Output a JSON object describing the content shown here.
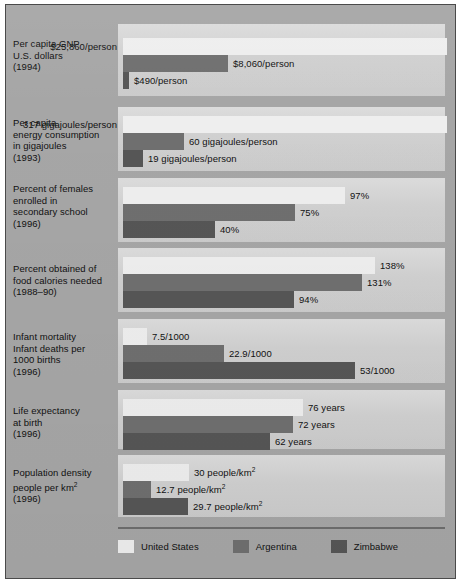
{
  "figure": {
    "width": 461,
    "height": 583,
    "background_color": "#a6a6a6",
    "panel_color": "#d2d2d2",
    "border_color": "#4a4a4a"
  },
  "legend": {
    "position": "bottom-left",
    "items": [
      {
        "label": "United States",
        "color": "#eeeeee",
        "key": "united_states"
      },
      {
        "label": "Argentina",
        "color": "#6f6f6f",
        "key": "argentina"
      },
      {
        "label": "Zimbabwe",
        "color": "#565656",
        "key": "zimbabwe"
      }
    ]
  },
  "chart_data": {
    "type": "bar",
    "orientation": "horizontal",
    "title": "",
    "subtitle": "",
    "xlabel": "",
    "ylabel": "",
    "grid": false,
    "legend_position": "bottom-left",
    "series": [
      {
        "name": "United States",
        "color": "#eeeeee"
      },
      {
        "name": "Argentina",
        "color": "#6f6f6f"
      },
      {
        "name": "Zimbabwe",
        "color": "#565656"
      }
    ],
    "categories": [
      "Per capita GNP U.S. dollars (1994)",
      "Per capita energy consumption in gigajoules (1993)",
      "Percent of females enrolled in secondary school (1996)",
      "Percent obtained of food calories needed (1988–90)",
      "Infant mortality Infant deaths per 1000 births (1996)",
      "Life expectancy at birth (1996)",
      "Population density people per km2 (1996)"
    ],
    "groups": [
      {
        "label_lines": [
          "Per capita GNP",
          "U.S. dollars",
          "(1994)"
        ],
        "unit": "/person",
        "max_value": 25860,
        "bars": [
          {
            "series": "United States",
            "value": 25860,
            "value_label": "$25,860/person",
            "bar_px": 324,
            "label_px": 325,
            "label_align": "right",
            "label_right_px": 6
          },
          {
            "series": "Argentina",
            "value": 8060,
            "value_label": "$8,060/person",
            "bar_px": 105,
            "label_px": 110
          },
          {
            "series": "Zimbabwe",
            "value": 490,
            "value_label": "$490/person",
            "bar_px": 6,
            "label_px": 11
          }
        ]
      },
      {
        "label_lines": [
          "Per capita",
          "energy consumption",
          "in gigajoules",
          "(1993)"
        ],
        "unit": " gigajoules/person",
        "max_value": 317,
        "bars": [
          {
            "series": "United States",
            "value": 317,
            "value_label": "317 gigajoules/person",
            "bar_px": 324,
            "label_px": 325,
            "label_align": "right",
            "label_right_px": 6
          },
          {
            "series": "Argentina",
            "value": 60,
            "value_label": "60 gigajoules/person",
            "bar_px": 61,
            "label_px": 66
          },
          {
            "series": "Zimbabwe",
            "value": 19,
            "value_label": "19 gigajoules/person",
            "bar_px": 20,
            "label_px": 25
          }
        ]
      },
      {
        "label_lines": [
          "Percent of females",
          "enrolled in",
          "secondary school",
          "(1996)"
        ],
        "unit": "%",
        "max_value": 97,
        "bars": [
          {
            "series": "United States",
            "value": 97,
            "value_label": "97%",
            "bar_px": 222,
            "label_px": 227
          },
          {
            "series": "Argentina",
            "value": 75,
            "value_label": "75%",
            "bar_px": 172,
            "label_px": 177
          },
          {
            "series": "Zimbabwe",
            "value": 40,
            "value_label": "40%",
            "bar_px": 92,
            "label_px": 97
          }
        ]
      },
      {
        "label_lines": [
          "Percent obtained of",
          "food calories needed",
          "(1988–90)"
        ],
        "unit": "%",
        "max_value": 138,
        "bars": [
          {
            "series": "United States",
            "value": 138,
            "value_label": "138%",
            "bar_px": 252,
            "label_px": 257
          },
          {
            "series": "Argentina",
            "value": 131,
            "value_label": "131%",
            "bar_px": 239,
            "label_px": 244
          },
          {
            "series": "Zimbabwe",
            "value": 94,
            "value_label": "94%",
            "bar_px": 171,
            "label_px": 176
          }
        ]
      },
      {
        "label_lines": [
          "Infant mortality",
          "Infant deaths per",
          "1000 births",
          "(1996)"
        ],
        "unit": "/1000",
        "max_value": 53,
        "bars": [
          {
            "series": "United States",
            "value": 7.5,
            "value_label": "7.5/1000",
            "bar_px": 24,
            "label_px": 29
          },
          {
            "series": "Argentina",
            "value": 22.9,
            "value_label": "22.9/1000",
            "bar_px": 101,
            "label_px": 106
          },
          {
            "series": "Zimbabwe",
            "value": 53,
            "value_label": "53/1000",
            "bar_px": 232,
            "label_px": 237
          }
        ]
      },
      {
        "label_lines": [
          "Life expectancy",
          "at birth",
          "(1996)"
        ],
        "unit": " years",
        "max_value": 76,
        "bars": [
          {
            "series": "United States",
            "value": 76,
            "value_label": "76 years",
            "bar_px": 180,
            "label_px": 185
          },
          {
            "series": "Argentina",
            "value": 72,
            "value_label": "72 years",
            "bar_px": 170,
            "label_px": 175
          },
          {
            "series": "Zimbabwe",
            "value": 62,
            "value_label": "62 years",
            "bar_px": 147,
            "label_px": 152
          }
        ]
      },
      {
        "label_lines": [
          "Population density",
          "people per km2",
          "(1996)"
        ],
        "label_sup_line": 1,
        "unit": " people/km2",
        "max_value": 30,
        "bars": [
          {
            "series": "United States",
            "value": 30,
            "value_label": "30 people/km",
            "value_sup": "2",
            "bar_px": 66,
            "label_px": 71
          },
          {
            "series": "Argentina",
            "value": 12.7,
            "value_label": "12.7 people/km",
            "value_sup": "2",
            "bar_px": 28,
            "label_px": 33
          },
          {
            "series": "Zimbabwe",
            "value": 29.7,
            "value_label": "29.7 people/km",
            "value_sup": "2",
            "bar_px": 65,
            "label_px": 70
          }
        ]
      }
    ]
  }
}
